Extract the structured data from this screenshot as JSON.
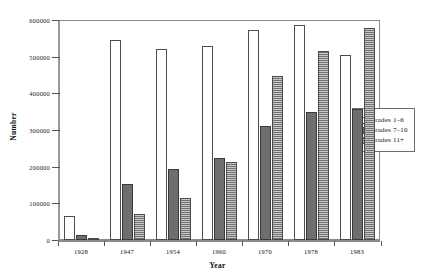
{
  "chart_data": {
    "type": "bar",
    "title": "",
    "xlabel": "Year",
    "ylabel": "Number",
    "categories": [
      "1928",
      "1947",
      "1954",
      "1960",
      "1970",
      "1978",
      "1983"
    ],
    "series": [
      {
        "name": "Grades 1–6",
        "color": "#ffffff",
        "values": [
          65000,
          546000,
          522000,
          530000,
          574000,
          586000,
          505000
        ]
      },
      {
        "name": "Grades 7–10",
        "color": "#6e6e6e",
        "values": [
          13000,
          152000,
          193000,
          225000,
          312000,
          350000,
          357000
        ]
      },
      {
        "name": "Grades 11+",
        "color": "#a8a8a8",
        "values": [
          4000,
          70000,
          115000,
          214000,
          447000,
          515000,
          578000
        ]
      }
    ],
    "ylim": [
      0,
      600000
    ],
    "yticks": [
      0,
      100000,
      200000,
      300000,
      400000,
      500000,
      600000
    ],
    "ytick_labels": [
      "0",
      "100000",
      "200000",
      "300000",
      "400000",
      "500000",
      "600000"
    ],
    "grid": false,
    "legend_position": "right-middle"
  },
  "legend": {
    "items": [
      {
        "label": "Grades 1–6",
        "swatch": "swatch-open"
      },
      {
        "label": "Grades 7–10",
        "swatch": "swatch-solid-gray"
      },
      {
        "label": "Grades 11+",
        "swatch": "swatch-hatched-gray"
      }
    ]
  }
}
